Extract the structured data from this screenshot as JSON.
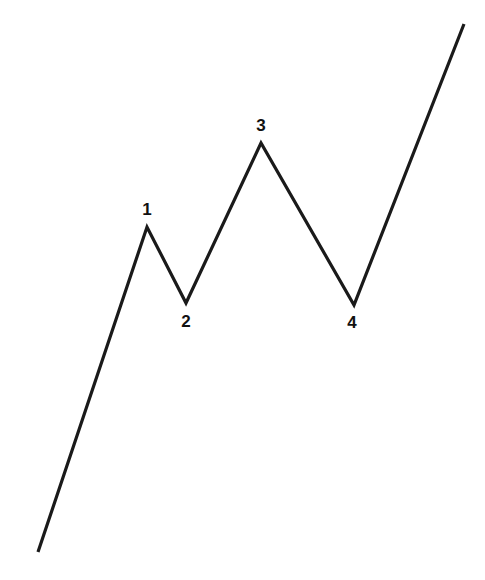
{
  "figure": {
    "background_color": "#ffffff",
    "line_color": "#1a1a1a",
    "line_width": 3.2,
    "width": 485,
    "height": 580,
    "label_color": "#111111",
    "label_font_size": 17
  },
  "chart_data": {
    "type": "line",
    "title": "",
    "subtitle": "",
    "xlabel": "",
    "ylabel": "",
    "xlim": [
      0,
      485
    ],
    "ylim": [
      0,
      580
    ],
    "grid": false,
    "axes_visible": false,
    "legend": null,
    "series": [
      {
        "name": "impulse-wave",
        "x": [
          38,
          147,
          186,
          261,
          354,
          464
        ],
        "y": [
          552,
          227,
          303,
          143,
          305,
          24
        ],
        "points": [
          {
            "label": "",
            "x": 38,
            "y": 552,
            "kind": "start"
          },
          {
            "label": "1",
            "x": 147,
            "y": 227,
            "kind": "peak"
          },
          {
            "label": "2",
            "x": 186,
            "y": 303,
            "kind": "trough"
          },
          {
            "label": "3",
            "x": 261,
            "y": 143,
            "kind": "peak"
          },
          {
            "label": "4",
            "x": 354,
            "y": 305,
            "kind": "trough"
          },
          {
            "label": "",
            "x": 464,
            "y": 24,
            "kind": "end"
          }
        ]
      }
    ],
    "annotations": [
      {
        "text": "1",
        "x": 147,
        "y": 209,
        "anchor": "center"
      },
      {
        "text": "2",
        "x": 186,
        "y": 321,
        "anchor": "center"
      },
      {
        "text": "3",
        "x": 261,
        "y": 125,
        "anchor": "center"
      },
      {
        "text": "4",
        "x": 352,
        "y": 322,
        "anchor": "center"
      }
    ]
  },
  "labels": {
    "one": "1",
    "two": "2",
    "three": "3",
    "four": "4"
  }
}
